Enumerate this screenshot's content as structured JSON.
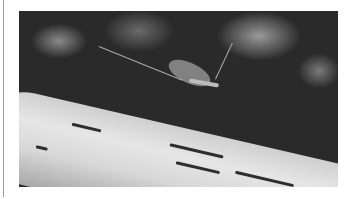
{
  "image": {
    "subject": "mayfly resting on a birch branch",
    "style": "black and white photograph",
    "colors": {
      "background": "#ffffff",
      "rule": "#9a9a9a",
      "bark": "#e0e0e0",
      "bokeh": "#2a2a2a"
    }
  }
}
